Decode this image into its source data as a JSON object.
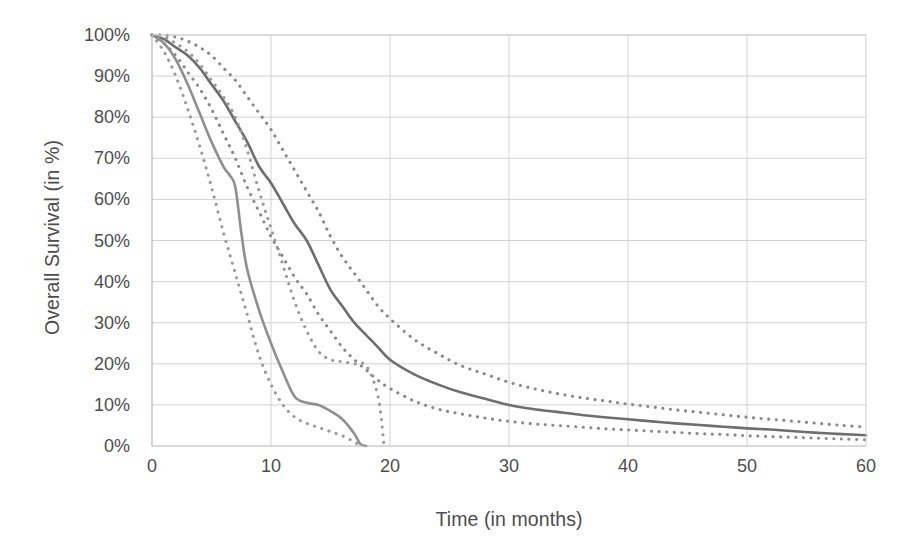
{
  "chart_data": {
    "type": "line",
    "title": "",
    "subtitle": "",
    "xlabel": "Time (in months)",
    "ylabel": "Overall Survival (in %)",
    "xlim": [
      0,
      60
    ],
    "ylim": [
      0,
      100
    ],
    "xticks": [
      0,
      10,
      20,
      30,
      40,
      50,
      60
    ],
    "xtick_labels": [
      "0",
      "10",
      "20",
      "30",
      "40",
      "50",
      "60"
    ],
    "yticks": [
      0,
      10,
      20,
      30,
      40,
      50,
      60,
      70,
      80,
      90,
      100
    ],
    "ytick_labels": [
      "0%",
      "10%",
      "20%",
      "30%",
      "40%",
      "50%",
      "60%",
      "70%",
      "80%",
      "90%",
      "100%"
    ],
    "grid": true,
    "grid_color": "#d3d3d3",
    "legend": null,
    "legend_position": "none",
    "annotations": [],
    "series": [
      {
        "name": "Overall survival (main cohort)",
        "style": "solid",
        "color": "#6e6e6e",
        "x": [
          0,
          1,
          2,
          3,
          4,
          5,
          6,
          7,
          8,
          9,
          10,
          11,
          12,
          13,
          14,
          15,
          16,
          17,
          18,
          19,
          20,
          22,
          24,
          26,
          28,
          30,
          32,
          34,
          36,
          38,
          40,
          42,
          44,
          46,
          48,
          50,
          52,
          54,
          56,
          58,
          60
        ],
        "values": [
          100,
          99,
          97,
          95,
          92,
          88,
          84,
          79,
          74,
          68,
          64,
          59,
          54,
          50,
          44,
          38,
          34,
          30,
          27,
          24,
          21,
          17.5,
          15,
          13,
          11.5,
          10,
          9,
          8.3,
          7.6,
          7,
          6.5,
          6,
          5.5,
          5.1,
          4.7,
          4.3,
          4,
          3.6,
          3.2,
          2.9,
          2.6
        ]
      },
      {
        "name": "Overall survival (main cohort) — upper 95% CI",
        "style": "dotted",
        "color": "#8a8a8a",
        "x": [
          0,
          1,
          2,
          3,
          4,
          5,
          6,
          7,
          8,
          9,
          10,
          11,
          12,
          13,
          14,
          15,
          16,
          17,
          18,
          19,
          20,
          22,
          24,
          26,
          28,
          30,
          32,
          34,
          36,
          38,
          40,
          42,
          44,
          46,
          48,
          50,
          52,
          54,
          56,
          58,
          60
        ],
        "values": [
          100,
          100,
          99.5,
          98.5,
          97,
          95,
          92,
          89,
          85,
          81,
          77,
          72,
          67,
          62,
          57,
          51,
          46,
          42,
          38,
          34,
          31,
          26,
          22.5,
          19.5,
          17.5,
          15.5,
          14,
          12.8,
          11.8,
          11,
          10.2,
          9.5,
          8.8,
          8.2,
          7.6,
          7,
          6.5,
          6,
          5.5,
          5,
          4.6
        ]
      },
      {
        "name": "Overall survival (main cohort) — lower 95% CI",
        "style": "dotted",
        "color": "#8a8a8a",
        "x": [
          0,
          1,
          2,
          3,
          4,
          5,
          6,
          7,
          8,
          9,
          10,
          11,
          12,
          13,
          14,
          15,
          16,
          17,
          18,
          19,
          20,
          22,
          24,
          26,
          28,
          30,
          32,
          34,
          36,
          38,
          40,
          42,
          44,
          46,
          48,
          50,
          52,
          54,
          56,
          58,
          60
        ],
        "values": [
          100,
          98,
          95,
          91,
          87,
          82,
          76,
          70,
          63,
          57,
          51,
          46,
          41,
          37,
          32,
          28,
          24,
          21,
          18.5,
          16,
          14,
          11,
          9,
          7.8,
          6.8,
          6,
          5.4,
          5,
          4.6,
          4.2,
          3.9,
          3.6,
          3.3,
          3,
          2.8,
          2.5,
          2.3,
          2.1,
          1.9,
          1.7,
          1.5
        ]
      },
      {
        "name": "Overall survival (poor-prognosis subgroup)",
        "style": "solid",
        "color": "#8f8f8f",
        "x": [
          0,
          1,
          2,
          3,
          4,
          5,
          6,
          6.5,
          7,
          7.5,
          8,
          9,
          10,
          11,
          12,
          13,
          14,
          15,
          16,
          17,
          17.5,
          18
        ],
        "values": [
          100,
          98,
          94,
          88,
          81,
          74,
          68,
          66,
          63,
          52,
          43,
          33,
          25,
          18,
          12,
          10.5,
          10,
          8.5,
          6.5,
          3,
          0.5,
          0
        ]
      },
      {
        "name": "Overall survival (poor-prognosis subgroup) — upper 95% CI",
        "style": "dotted",
        "color": "#9a9a9a",
        "x": [
          0,
          1,
          2,
          3,
          4,
          5,
          6,
          7,
          8,
          9,
          10,
          11,
          12,
          13,
          14,
          15,
          16,
          17,
          18,
          19,
          19.5
        ],
        "values": [
          100,
          99.5,
          98,
          96,
          93,
          89,
          85,
          80,
          72,
          62,
          53,
          44,
          35,
          28,
          23,
          21,
          20.5,
          20,
          19.5,
          12,
          0
        ]
      },
      {
        "name": "Overall survival (poor-prognosis subgroup) — lower 95% CI",
        "style": "dotted",
        "color": "#9a9a9a",
        "x": [
          0,
          1,
          2,
          3,
          4,
          5,
          6,
          7,
          8,
          9,
          10,
          11,
          12,
          13,
          14,
          15,
          16,
          17,
          17.5
        ],
        "values": [
          100,
          96,
          90,
          82,
          73,
          63,
          52,
          42,
          32,
          22,
          15,
          10,
          7,
          5.5,
          4.5,
          3.5,
          2.5,
          1,
          0
        ]
      }
    ]
  },
  "axes": {
    "x_title": "Time (in months)",
    "y_title": "Overall Survival (in %)"
  }
}
